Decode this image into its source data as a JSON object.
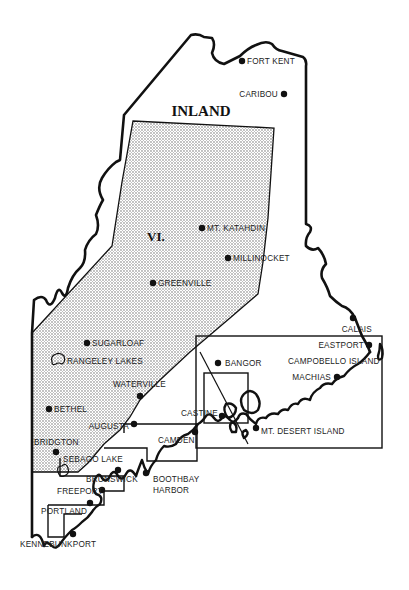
{
  "map": {
    "title": "INLAND",
    "region_number": "VI.",
    "colors": {
      "ink": "#111111",
      "background": "#ffffff",
      "stipple": "#555555"
    },
    "towns": [
      {
        "name": "FORT KENT",
        "x": 242,
        "y": 61
      },
      {
        "name": "CARIBOU",
        "x": 284,
        "y": 94
      },
      {
        "name": "MT. KATAHDIN",
        "x": 202,
        "y": 228
      },
      {
        "name": "MILLINOCKET",
        "x": 227,
        "y": 257
      },
      {
        "name": "GREENVILLE",
        "x": 152,
        "y": 283
      },
      {
        "name": "SUGARLOAF",
        "x": 86,
        "y": 343
      },
      {
        "name": "RANGELEY LAKES",
        "x": 60,
        "y": 360
      },
      {
        "name": "WATERVILLE",
        "x": 140,
        "y": 396
      },
      {
        "name": "BETHEL",
        "x": 49,
        "y": 409
      },
      {
        "name": "AUGUSTA",
        "x": 134,
        "y": 423
      },
      {
        "name": "BRIDGTON",
        "x": 55,
        "y": 452
      },
      {
        "name": "SEBAGO LAKE",
        "x": 60,
        "y": 470
      },
      {
        "name": "BRUNSWICK",
        "x": 118,
        "y": 470
      },
      {
        "name": "FREEPORT",
        "x": 102,
        "y": 489
      },
      {
        "name": "PORTLAND",
        "x": 92,
        "y": 505
      },
      {
        "name": "KENNEBUNKPORT",
        "x": 73,
        "y": 535
      },
      {
        "name": "BOOTHBAY HARBOR",
        "x": 146,
        "y": 473
      },
      {
        "name": "CAMDEN",
        "x": 195,
        "y": 433
      },
      {
        "name": "CASTINE",
        "x": 226,
        "y": 415
      },
      {
        "name": "MT. DESERT ISLAND",
        "x": 256,
        "y": 427
      },
      {
        "name": "BANGOR",
        "x": 218,
        "y": 363
      },
      {
        "name": "MACHIAS",
        "x": 336,
        "y": 377
      },
      {
        "name": "CAMPOBELLO ISLAND",
        "x": 372,
        "y": 360
      },
      {
        "name": "EASTPORT",
        "x": 370,
        "y": 346
      },
      {
        "name": "CALAIS",
        "x": 372,
        "y": 320
      }
    ],
    "labels": {
      "fort_kent": "FORT KENT",
      "caribou": "CARIBOU",
      "mt_katahdin": "MT. KATAHDIN",
      "millinocket": "MILLINOCKET",
      "greenville": "GREENVILLE",
      "sugarloaf": "SUGARLOAF",
      "rangeley_lakes": "RANGELEY LAKES",
      "waterville": "WATERVILLE",
      "bethel": "BETHEL",
      "augusta": "AUGUSTA",
      "bridgton": "BRIDGTON",
      "sebago_lake": "SEBAGO LAKE",
      "brunswick": "BRUNSWICK",
      "freeport": "FREEPORT",
      "portland": "PORTLAND",
      "kennebunkport": "KENNEBUNKPORT",
      "boothbay": "BOOTHBAY",
      "harbor": "HARBOR",
      "camden": "CAMDEN",
      "castine": "CASTINE",
      "mt_desert_island": "MT. DESERT ISLAND",
      "bangor": "BANGOR",
      "machias": "MACHIAS",
      "campobello_island": "CAMPOBELLO ISLAND",
      "eastport": "EASTPORT",
      "calais": "CALAIS"
    }
  }
}
